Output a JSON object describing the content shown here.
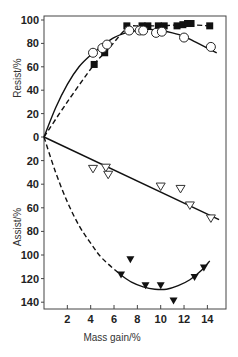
{
  "chart_data": {
    "type": "scatter",
    "title": "",
    "xlabel": "Mass gain/%",
    "ylabel_top": "Resist/%",
    "ylabel_bottom": "Assist/%",
    "xlim": [
      0,
      15.5
    ],
    "ylim_top": [
      0,
      100
    ],
    "ylim_bottom": [
      0,
      145
    ],
    "x_ticks": [
      2,
      4,
      6,
      8,
      10,
      12,
      14
    ],
    "y_ticks_top": [
      100,
      80,
      60,
      40,
      20,
      0
    ],
    "y_ticks_bottom": [
      20,
      40,
      60,
      80,
      100,
      120,
      140
    ],
    "grid": false,
    "legend": "none",
    "series": [
      {
        "name": "Resist (filled squares)",
        "panel": "resist",
        "marker": "filled-square",
        "line": "dashed",
        "points": [
          [
            4.3,
            62
          ],
          [
            5.2,
            72
          ],
          [
            7.1,
            95
          ],
          [
            8.4,
            95
          ],
          [
            8.9,
            95
          ],
          [
            9.8,
            95
          ],
          [
            10.3,
            95
          ],
          [
            11.4,
            95
          ],
          [
            11.9,
            96
          ],
          [
            12.3,
            97
          ],
          [
            12.6,
            97
          ],
          [
            14.2,
            95
          ]
        ],
        "curve": [
          [
            0,
            0
          ],
          [
            2,
            30
          ],
          [
            4.3,
            62
          ],
          [
            5.5,
            75
          ],
          [
            7.1,
            93
          ],
          [
            8,
            95
          ],
          [
            10,
            95
          ],
          [
            12,
            96
          ],
          [
            14.2,
            95
          ]
        ]
      },
      {
        "name": "Resist (open circles)",
        "panel": "resist",
        "marker": "open-circle",
        "line": "solid",
        "points": [
          [
            4.2,
            72
          ],
          [
            5.0,
            76
          ],
          [
            5.4,
            79
          ],
          [
            7.3,
            91
          ],
          [
            8.2,
            91
          ],
          [
            8.5,
            91
          ],
          [
            9.6,
            89
          ],
          [
            10.1,
            90
          ],
          [
            12.0,
            85
          ],
          [
            14.3,
            77
          ]
        ],
        "curve": [
          [
            0,
            0
          ],
          [
            1,
            25
          ],
          [
            2,
            45
          ],
          [
            3,
            60
          ],
          [
            4,
            70
          ],
          [
            5,
            78
          ],
          [
            6,
            85
          ],
          [
            7,
            89
          ],
          [
            8,
            91
          ],
          [
            9,
            92
          ],
          [
            10,
            91
          ],
          [
            11,
            89
          ],
          [
            12,
            86
          ],
          [
            13,
            81
          ],
          [
            14,
            76
          ],
          [
            14.8,
            72
          ]
        ]
      },
      {
        "name": "Assist (open triangles)",
        "panel": "assist",
        "marker": "open-triangle-down",
        "line": "solid",
        "points": [
          [
            4.2,
            27
          ],
          [
            5.3,
            26
          ],
          [
            5.5,
            32
          ],
          [
            10.0,
            42
          ],
          [
            11.7,
            44
          ],
          [
            12.5,
            58
          ],
          [
            14.3,
            69
          ]
        ],
        "curve": [
          [
            0,
            0
          ],
          [
            15,
            70
          ]
        ]
      },
      {
        "name": "Assist (filled triangles)",
        "panel": "assist",
        "marker": "filled-triangle-down",
        "line": "dashed-then-solid",
        "points": [
          [
            7.4,
            104
          ],
          [
            6.6,
            117
          ],
          [
            8.7,
            126
          ],
          [
            10.0,
            126
          ],
          [
            11.1,
            139
          ],
          [
            12.9,
            119
          ],
          [
            13.7,
            111
          ]
        ],
        "curve_dashed": [
          [
            0,
            0
          ],
          [
            1,
            30
          ],
          [
            2,
            55
          ],
          [
            3,
            75
          ],
          [
            4,
            90
          ],
          [
            5,
            103
          ],
          [
            6.6,
            117
          ]
        ],
        "curve_solid": [
          [
            6.6,
            117
          ],
          [
            7.5,
            123
          ],
          [
            8.5,
            127
          ],
          [
            9.5,
            129
          ],
          [
            10.5,
            129
          ],
          [
            11.5,
            126
          ],
          [
            12.5,
            121
          ],
          [
            13.5,
            113
          ],
          [
            14.2,
            105
          ]
        ]
      }
    ]
  },
  "labels": {
    "xlabel": "Mass gain/%",
    "ylabel_top": "Resist/%",
    "ylabel_bottom": "Assist/%"
  }
}
